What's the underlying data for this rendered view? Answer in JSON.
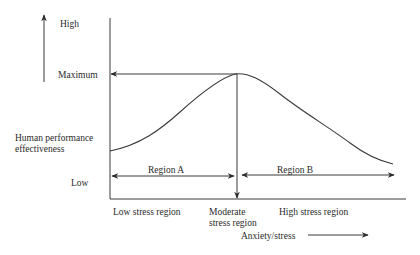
{
  "diagram": {
    "type": "performance-stress curve (Yerkes-Dodson style)",
    "y_axis": {
      "high_label": "High",
      "maximum_label": "Maximum",
      "title_line1": "Human performance",
      "title_line2": "effectiveness",
      "low_label": "Low"
    },
    "x_axis": {
      "low_region_label": "Low stress region",
      "moderate_region_line1": "Moderate",
      "moderate_region_line2": "stress region",
      "high_region_label": "High stress region",
      "title": "Anxiety/stress"
    },
    "regions": {
      "a_label": "Region A",
      "b_label": "Region B"
    },
    "colors": {
      "stroke": "#3a3a3a",
      "text": "#2a2a2a",
      "background": "#ffffff"
    }
  }
}
